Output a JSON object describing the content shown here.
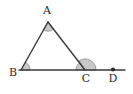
{
  "figure": {
    "type": "geometry-diagram",
    "background_color": "#ffffff",
    "stroke_color": "#3a3a3a",
    "angle_fill_color": "#c9c9c9",
    "angle_stroke_color": "#8a8a8a",
    "label_color": "#2b2b2b"
  },
  "points": {
    "A": {
      "label": "A",
      "x": 48,
      "y": 22,
      "label_x": 47,
      "label_y": 14
    },
    "B": {
      "label": "B",
      "x": 21,
      "y": 70,
      "label_x": 13,
      "label_y": 76
    },
    "C": {
      "label": "C",
      "x": 85,
      "y": 70,
      "label_x": 86,
      "label_y": 82
    },
    "D": {
      "label": "D",
      "x": 113,
      "y": 70,
      "label_x": 113,
      "label_y": 82
    }
  },
  "segments": [
    {
      "name": "side-AB",
      "from": "A",
      "to": "B"
    },
    {
      "name": "side-AC",
      "from": "A",
      "to": "C"
    },
    {
      "name": "base-line-BD",
      "from": "B",
      "to": "D"
    }
  ],
  "angle_markers": [
    {
      "name": "angle-A",
      "vertex": "A",
      "radius": 9,
      "shaded": true
    },
    {
      "name": "angle-B",
      "vertex": "B",
      "radius": 9,
      "shaded": true
    },
    {
      "name": "angle-ACB-interior",
      "vertex": "C",
      "radius": 9,
      "shaded": true
    },
    {
      "name": "angle-ACD-exterior",
      "vertex": "C",
      "radius": 11,
      "shaded": true
    }
  ],
  "markers": [
    {
      "name": "point-dot-D",
      "at": "D",
      "radius": 2
    }
  ],
  "labels": {
    "a": "A",
    "b": "B",
    "c": "C",
    "d": "D"
  }
}
